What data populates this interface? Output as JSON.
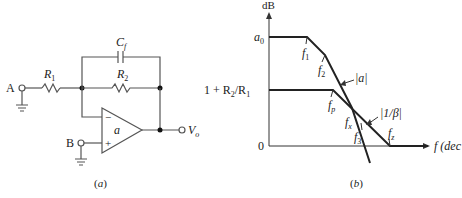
{
  "figure_a": {
    "caption": "(a)",
    "terminal_a": "A",
    "terminal_b": "B",
    "r1": "R",
    "r1_sub": "1",
    "r2": "R",
    "r2_sub": "2",
    "cf": "C",
    "cf_sub": "f",
    "opamp_gain": "a",
    "inverting": "−",
    "noninverting": "+",
    "output": "V",
    "output_sub": "o"
  },
  "figure_b": {
    "caption": "(b)",
    "y_axis_label": "dB",
    "x_axis_label": "f (dec",
    "y_tick_a0": "a",
    "y_tick_a0_sub": "0",
    "y_tick_gain": "1 + R",
    "y_tick_gain_sub1": "2",
    "y_tick_gain_mid": "/R",
    "y_tick_gain_sub2": "1",
    "y_tick_zero": "0",
    "curve_a_label": "|a|",
    "curve_beta_label": "|1/β|",
    "f1": "f",
    "f1_sub": "1",
    "f2": "f",
    "f2_sub": "2",
    "fp": "f",
    "fp_sub": "p",
    "fx": "f",
    "fx_sub": "x",
    "f3": "f",
    "f3_sub": "3",
    "fz": "f",
    "fz_sub": "z"
  }
}
